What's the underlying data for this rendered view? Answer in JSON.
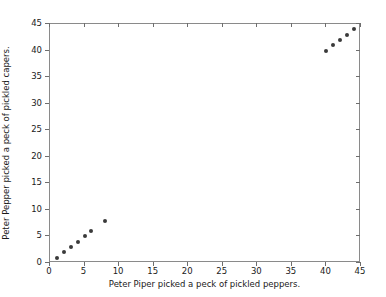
{
  "chart_data": {
    "type": "scatter",
    "title": "",
    "xlabel": "Peter Piper picked a peck of pickled peppers.",
    "ylabel": "Peter Pepper picked a peck of pickled capers.",
    "xlim": [
      0,
      45
    ],
    "ylim": [
      0,
      45
    ],
    "xticks": [
      0,
      5,
      10,
      15,
      20,
      25,
      30,
      35,
      40,
      45
    ],
    "yticks": [
      0,
      5,
      10,
      15,
      20,
      25,
      30,
      35,
      40,
      45
    ],
    "xticklabels": [
      "0",
      "5",
      "10",
      "15",
      "20",
      "25",
      "30",
      "35",
      "40",
      "45"
    ],
    "yticklabels": [
      "0",
      "5",
      "10",
      "15",
      "20",
      "25",
      "30",
      "35",
      "40",
      "45"
    ],
    "grid": false,
    "legend": null,
    "marker_color": "#3a3a3a",
    "marker_size": 4,
    "frame_color": "#8a8a8a",
    "background_color": "#ffffff",
    "series": [
      {
        "name": "points",
        "x": [
          1,
          2,
          3,
          4,
          5,
          6,
          8,
          40,
          41,
          42,
          43,
          44
        ],
        "y": [
          1,
          2,
          3,
          4,
          5,
          6,
          8,
          40,
          41,
          42,
          43,
          44
        ]
      }
    ]
  }
}
